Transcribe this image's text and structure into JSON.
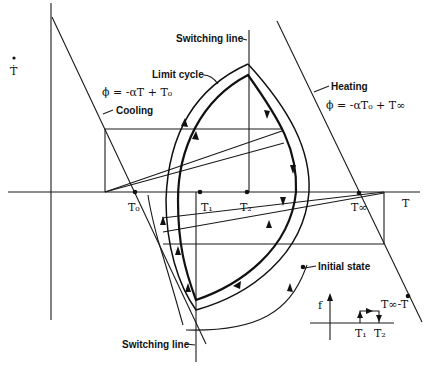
{
  "figure": {
    "axis_labels": {
      "y": "Ṫ",
      "x": "T"
    },
    "points": {
      "t0": "T₀",
      "t1": "T₁",
      "t2": "T₂",
      "tinf": "T∞"
    },
    "labels": {
      "switching_line_top": "Switching line",
      "switching_line_bottom": "Switching line",
      "limit_cycle": "Limit cycle",
      "cooling": "Cooling",
      "cooling_eq": "ϕ = -αT + T₀",
      "heating": "Heating",
      "heating_eq": "ϕ = -αT₀ + T∞",
      "initial_state": "Initial state",
      "tinf_minus_t": "T∞-T",
      "inset_f": "f",
      "inset_t1": "T₁",
      "inset_t2": "T₂"
    }
  }
}
